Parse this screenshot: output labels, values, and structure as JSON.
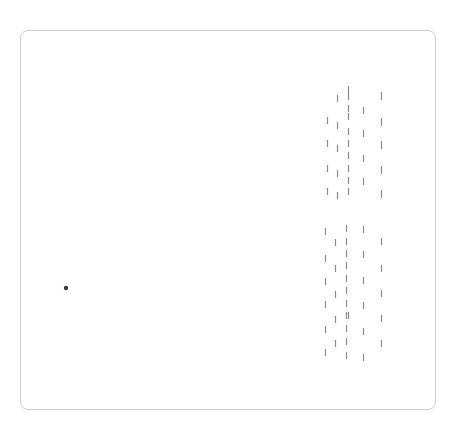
{
  "card": {
    "x": 20,
    "y": 30,
    "width": 416,
    "height": 380,
    "border_color": "#cfcfcf",
    "background": "#ffffff"
  },
  "colors": {
    "tick": "#8a8a8a",
    "dot": "#3a3a3a"
  },
  "dot": {
    "x": 66,
    "y": 288,
    "r": 2.2
  },
  "tick_groups": [
    {
      "name": "upper-group",
      "columns": [
        {
          "x": 327.5,
          "len": 7,
          "ys": [
            117,
            140,
            165,
            188
          ]
        },
        {
          "x": 337.5,
          "len": 7,
          "ys": [
            95,
            122,
            145,
            170,
            192
          ]
        },
        {
          "x": 348.5,
          "len": 7,
          "ys": [
            86,
            93,
            105,
            113,
            128,
            140,
            152,
            165,
            177,
            188
          ]
        },
        {
          "x": 363.5,
          "len": 7,
          "ys": [
            107,
            130,
            155,
            178
          ]
        },
        {
          "x": 381.5,
          "len": 8,
          "ys": [
            92,
            118,
            141,
            166,
            190
          ]
        }
      ]
    },
    {
      "name": "lower-group",
      "columns": [
        {
          "x": 325.5,
          "len": 7,
          "ys": [
            228,
            255,
            278,
            301,
            326,
            349
          ]
        },
        {
          "x": 335.5,
          "len": 7,
          "ys": [
            239,
            265,
            291,
            316,
            340
          ]
        },
        {
          "x": 346.5,
          "len": 7,
          "ys": [
            225,
            238,
            250,
            262,
            275,
            287,
            300,
            312,
            325,
            338,
            352
          ]
        },
        {
          "x": 348.5,
          "len": 7,
          "ys": [
            312
          ]
        },
        {
          "x": 363.5,
          "len": 7,
          "ys": [
            226,
            251,
            277,
            302,
            328,
            354
          ]
        },
        {
          "x": 381.5,
          "len": 7,
          "ys": [
            238,
            265,
            290,
            315,
            340
          ]
        }
      ]
    }
  ]
}
